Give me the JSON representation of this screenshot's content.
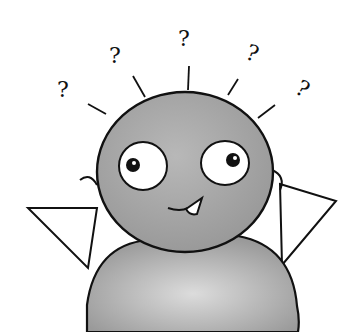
{
  "illustration": {
    "title": "Confused cartoon character with question marks",
    "question_marks": [
      "?",
      "?",
      "?",
      "?",
      "?"
    ],
    "colors": {
      "background": "#ffffff",
      "body_fill": "#a8a8a8",
      "outline": "#111111",
      "eye_white": "#ffffff"
    }
  }
}
